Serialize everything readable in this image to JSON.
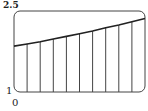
{
  "chart_data": {
    "type": "bar",
    "subtype": "riemann-sum-rectangles-under-curve",
    "title": "",
    "xlabel": "",
    "ylabel": "",
    "x_tick_labels": [
      "0"
    ],
    "y_tick_labels": [
      "1",
      "2.5"
    ],
    "right_edge_label_cropped": "",
    "xlim": [
      0,
      10
    ],
    "ylim": [
      1,
      2.5
    ],
    "grid": false,
    "legend": null,
    "rectangles": 10,
    "x": [
      0,
      1,
      2,
      3,
      4,
      5,
      6,
      7,
      8,
      9,
      10
    ],
    "curve_values": [
      1.85,
      1.89,
      1.93,
      1.98,
      2.03,
      2.08,
      2.13,
      2.19,
      2.24,
      2.3,
      2.36
    ],
    "colors": {
      "line": "#222222",
      "frame": "#444444",
      "background": "#ffffff"
    }
  },
  "labels": {
    "y_top": "2.5",
    "y_bottom": "1",
    "x_left": "0",
    "x_right": ""
  }
}
